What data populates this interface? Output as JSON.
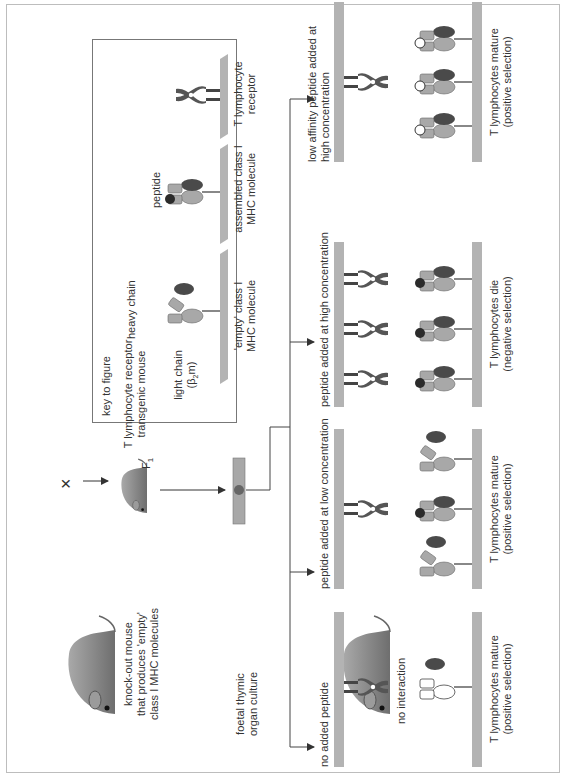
{
  "figure": {
    "orientation": "rotated-90-ccw",
    "cross": {
      "parent1_label": "knock-out mouse\nthat produces 'empty'\nclass I MHC molecules",
      "parent1_line1": "knock-out mouse",
      "parent1_line2": "that produces 'empty'",
      "parent1_line3": "class I MHC molecules",
      "cross_symbol": "×",
      "parent2_line1": "T lymphocyte receptor",
      "parent2_line2": "transgenic mouse",
      "offspring_label": "F",
      "offspring_subscript": "1"
    },
    "culture": {
      "line1": "foetal thymic",
      "line2": "organ culture"
    },
    "key": {
      "title": "key to figure",
      "light_chain_line1": "light chain",
      "light_chain_line2": "(β",
      "light_chain_sub": "2",
      "light_chain_line2_end": "m)",
      "heavy_chain": "heavy chain",
      "empty_mhc_line1": "'empty' class I",
      "empty_mhc_line2": "MHC molecule",
      "peptide": "peptide",
      "assembled_line1": "assembled class I",
      "assembled_line2": "MHC molecule",
      "tcr_line1": "T lymphocyte",
      "tcr_line2": "receptor"
    },
    "conditions": [
      {
        "title": "no added peptide",
        "note": "no interaction",
        "outcome_line1": "T lymphocytes mature",
        "outcome_line2": "(positive selection)"
      },
      {
        "title": "peptide added at low concentration",
        "outcome_line1": "T lymphocytes mature",
        "outcome_line2": "(positive selection)"
      },
      {
        "title": "peptide added at high concentration",
        "outcome_line1": "T lymphocytes die",
        "outcome_line2": "(negative selection)"
      },
      {
        "title_line1": "low affinity peptide added at",
        "title_line2": "high concentration",
        "outcome_line1": "T lymphocytes mature",
        "outcome_line2": "(positive selection)"
      }
    ],
    "colors": {
      "membrane": "#b3b3b3",
      "tcr": "#555555",
      "heavy_chain": "#a8a8a8",
      "light_chain": "#4a4a4a",
      "peptide": "#2b2b2b",
      "mouse": "#8c8c8c",
      "line": "#444444"
    }
  }
}
